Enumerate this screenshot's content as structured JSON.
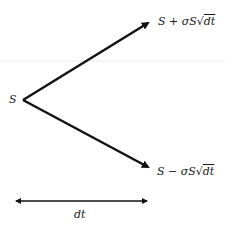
{
  "diagram": {
    "type": "binomial-tree",
    "root_label": "S",
    "up_label": {
      "prefix": "S + σS",
      "radical": "√",
      "radicand": "dt"
    },
    "down_label": {
      "prefix": "S − σS",
      "radical": "√",
      "radicand": "dt"
    },
    "time_step_label": "dt",
    "colors": {
      "stroke": "#111111",
      "text": "#1a1a1a",
      "background": "#ffffff",
      "faint_line": "#eeeeee"
    }
  }
}
